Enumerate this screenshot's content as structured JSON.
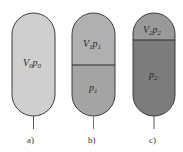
{
  "figure": {
    "panels": [
      {
        "id": "a",
        "caption": "a)",
        "upper": {
          "label_v": "V",
          "sub_v": "0",
          "label_p": "p",
          "sub_p": "0",
          "color": "#cfcfcf"
        },
        "lower": null
      },
      {
        "id": "b",
        "caption": "b)",
        "upper": {
          "label_v": "V",
          "sub_v": "1",
          "label_p": "p",
          "sub_p": "1",
          "color": "#b0b0b0"
        },
        "lower": {
          "label_p": "p",
          "sub_p": "1",
          "color": "#a4a4a4"
        }
      },
      {
        "id": "c",
        "caption": "c)",
        "upper": {
          "label_v": "V",
          "sub_v": "2",
          "label_p": "p",
          "sub_p": "2",
          "color": "#9a9a9a"
        },
        "lower": {
          "label_p": "p",
          "sub_p": "2",
          "color": "#7c7c7c"
        }
      }
    ],
    "colors": {
      "outline": "#3a3a3a",
      "stem": "#555555",
      "background": "#ffffff"
    }
  }
}
